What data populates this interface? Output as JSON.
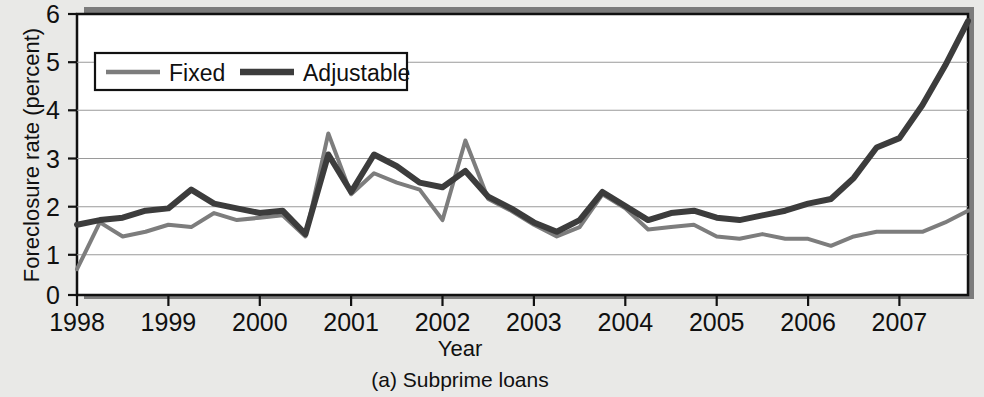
{
  "figure": {
    "caption": "(a) Subprime loans",
    "background_color": "#e9e9e7",
    "plot_background_color": "#ffffff",
    "shadow_color": "#7c7c7c"
  },
  "legend": {
    "position": "top-left-inside",
    "entries": [
      {
        "label": "Fixed",
        "color": "#7d7d7d",
        "width": 4
      },
      {
        "label": "Adjustable",
        "color": "#3c3c3c",
        "width": 6
      }
    ]
  },
  "chart_data": {
    "type": "line",
    "title": "",
    "subtitle": "",
    "caption": "(a) Subprime loans",
    "xlabel": "Year",
    "ylabel": "Foreclosure rate (percent)",
    "xlim": [
      1998.0,
      2007.75
    ],
    "ylim": [
      0,
      6
    ],
    "yticks": [
      0,
      1,
      2,
      3,
      4,
      5,
      6
    ],
    "ytick_labels": [
      "0",
      "1",
      "2",
      "3",
      "4",
      "5",
      "6"
    ],
    "xticks": [
      1998,
      1999,
      2000,
      2001,
      2002,
      2003,
      2004,
      2005,
      2006,
      2007
    ],
    "xtick_labels": [
      "1998",
      "1999",
      "2000",
      "2001",
      "2002",
      "2003",
      "2004",
      "2005",
      "2006",
      "2007"
    ],
    "grid": true,
    "grid_axis": "y",
    "legend_position": "upper left",
    "x": [
      1998.0,
      1998.25,
      1998.5,
      1998.75,
      1999.0,
      1999.25,
      1999.5,
      1999.75,
      2000.0,
      2000.25,
      2000.5,
      2000.75,
      2001.0,
      2001.25,
      2001.5,
      2001.75,
      2002.0,
      2002.25,
      2002.5,
      2002.75,
      2003.0,
      2003.25,
      2003.5,
      2003.75,
      2004.0,
      2004.25,
      2004.5,
      2004.75,
      2005.0,
      2005.25,
      2005.5,
      2005.75,
      2006.0,
      2006.25,
      2006.5,
      2006.75,
      2007.0,
      2007.25,
      2007.5,
      2007.75
    ],
    "series": [
      {
        "name": "Fixed",
        "color": "#7d7d7d",
        "width": 4,
        "values": [
          0.55,
          1.55,
          1.25,
          1.35,
          1.5,
          1.45,
          1.75,
          1.6,
          1.65,
          1.7,
          1.25,
          3.45,
          2.15,
          2.6,
          2.4,
          2.25,
          1.6,
          3.3,
          2.05,
          1.8,
          1.5,
          1.25,
          1.45,
          2.15,
          1.85,
          1.4,
          1.45,
          1.5,
          1.25,
          1.2,
          1.3,
          1.2,
          1.2,
          1.05,
          1.25,
          1.35,
          1.35,
          1.35,
          1.55,
          1.8
        ]
      },
      {
        "name": "Adjustable",
        "color": "#3c3c3c",
        "width": 6,
        "values": [
          1.5,
          1.6,
          1.65,
          1.8,
          1.85,
          2.25,
          1.95,
          1.85,
          1.75,
          1.8,
          1.3,
          3.0,
          2.2,
          3.0,
          2.75,
          2.4,
          2.3,
          2.65,
          2.1,
          1.85,
          1.55,
          1.35,
          1.6,
          2.2,
          1.9,
          1.6,
          1.75,
          1.8,
          1.65,
          1.6,
          1.7,
          1.8,
          1.95,
          2.05,
          2.5,
          3.15,
          3.35,
          4.05,
          4.9,
          5.85
        ]
      }
    ]
  }
}
